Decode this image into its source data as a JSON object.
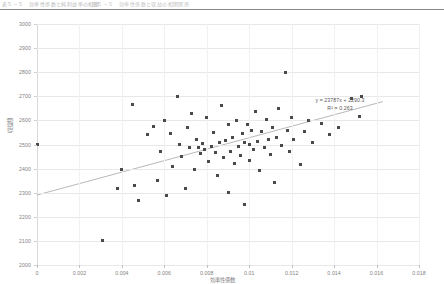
{
  "header": {
    "left_fragment": "表５－５　効率性係数と純利益率の相関",
    "right_fragment": "図５－５　効率性係数と収益の相関関係"
  },
  "chart_data": {
    "type": "scatter",
    "title": "",
    "xlabel": "効率性係数",
    "ylabel": "収益額",
    "xlim": [
      0,
      0.018
    ],
    "ylim": [
      2000,
      3000
    ],
    "xticks": [
      0,
      0.002,
      0.004,
      0.006,
      0.008,
      0.01,
      0.012,
      0.014,
      0.016,
      0.018
    ],
    "xticklabels": [
      "0",
      "0.002",
      "0.004",
      "0.006",
      "0.008",
      "0.01",
      "0.012",
      "0.014",
      "0.016",
      "0.018"
    ],
    "yticks": [
      2000,
      2100,
      2200,
      2300,
      2400,
      2500,
      2600,
      2700,
      2800,
      2900,
      3000
    ],
    "yticklabels": [
      "2000",
      "2100",
      "2200",
      "2300",
      "2400",
      "2500",
      "2600",
      "2700",
      "2800",
      "2900",
      "3000"
    ],
    "grid": true,
    "legend": false,
    "marker_color": "#4a4a4a",
    "trendline": {
      "equation": "y = 23787x + 2290.3",
      "r_squared_label": "R² = 0.263",
      "slope": 23787,
      "intercept": 2290.3,
      "r_squared": 0.263,
      "color": "#b0b0b0",
      "x_start": 0.0,
      "x_end": 0.0163
    },
    "annotations": [
      {
        "text": "y = 23787x + 2290.3",
        "x": 0.0122,
        "y": 2700
      },
      {
        "text": "R² = 0.263",
        "x": 0.0122,
        "y": 2672
      }
    ],
    "points": [
      [
        0.0,
        2498
      ],
      [
        0.0031,
        2103
      ],
      [
        0.0038,
        2318
      ],
      [
        0.004,
        2395
      ],
      [
        0.0045,
        2668
      ],
      [
        0.0046,
        2330
      ],
      [
        0.0048,
        2268
      ],
      [
        0.0052,
        2540
      ],
      [
        0.0055,
        2574
      ],
      [
        0.0057,
        2350
      ],
      [
        0.0058,
        2470
      ],
      [
        0.006,
        2600
      ],
      [
        0.0061,
        2290
      ],
      [
        0.0063,
        2545
      ],
      [
        0.0064,
        2408
      ],
      [
        0.0066,
        2700
      ],
      [
        0.0067,
        2502
      ],
      [
        0.0068,
        2452
      ],
      [
        0.007,
        2318
      ],
      [
        0.0071,
        2570
      ],
      [
        0.0072,
        2486
      ],
      [
        0.0073,
        2630
      ],
      [
        0.0074,
        2398
      ],
      [
        0.0075,
        2520
      ],
      [
        0.0076,
        2488
      ],
      [
        0.0077,
        2462
      ],
      [
        0.0078,
        2505
      ],
      [
        0.0079,
        2478
      ],
      [
        0.008,
        2612
      ],
      [
        0.0081,
        2430
      ],
      [
        0.0082,
        2492
      ],
      [
        0.0083,
        2548
      ],
      [
        0.0084,
        2468
      ],
      [
        0.0085,
        2372
      ],
      [
        0.0086,
        2508
      ],
      [
        0.0087,
        2660
      ],
      [
        0.0088,
        2444
      ],
      [
        0.0089,
        2518
      ],
      [
        0.009,
        2582
      ],
      [
        0.009,
        2300
      ],
      [
        0.0091,
        2472
      ],
      [
        0.0092,
        2530
      ],
      [
        0.0093,
        2420
      ],
      [
        0.0094,
        2600
      ],
      [
        0.0095,
        2490
      ],
      [
        0.0096,
        2455
      ],
      [
        0.0097,
        2545
      ],
      [
        0.0098,
        2510
      ],
      [
        0.0098,
        2252
      ],
      [
        0.0099,
        2585
      ],
      [
        0.01,
        2432
      ],
      [
        0.01,
        2498
      ],
      [
        0.0101,
        2560
      ],
      [
        0.0102,
        2478
      ],
      [
        0.0103,
        2636
      ],
      [
        0.0104,
        2512
      ],
      [
        0.0105,
        2392
      ],
      [
        0.0106,
        2552
      ],
      [
        0.0107,
        2488
      ],
      [
        0.0108,
        2602
      ],
      [
        0.0109,
        2520
      ],
      [
        0.011,
        2458
      ],
      [
        0.0111,
        2572
      ],
      [
        0.0112,
        2344
      ],
      [
        0.0113,
        2530
      ],
      [
        0.0114,
        2650
      ],
      [
        0.0115,
        2494
      ],
      [
        0.0117,
        2800
      ],
      [
        0.0118,
        2560
      ],
      [
        0.0119,
        2470
      ],
      [
        0.012,
        2612
      ],
      [
        0.0121,
        2520
      ],
      [
        0.0124,
        2418
      ],
      [
        0.0126,
        2556
      ],
      [
        0.0128,
        2600
      ],
      [
        0.013,
        2510
      ],
      [
        0.0134,
        2588
      ],
      [
        0.0138,
        2540
      ],
      [
        0.0142,
        2570
      ],
      [
        0.0148,
        2692
      ],
      [
        0.0152,
        2618
      ],
      [
        0.0153,
        2700
      ]
    ]
  }
}
